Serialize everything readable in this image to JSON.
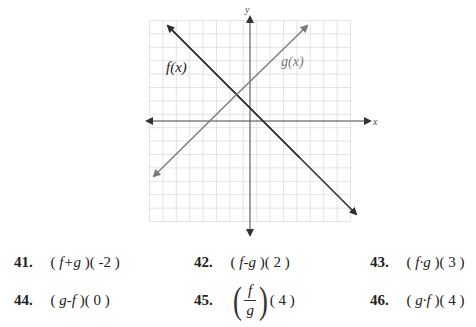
{
  "graph": {
    "x_axis_label": "x",
    "y_axis_label": "y",
    "f_label": "f(x)",
    "g_label": "g(x)",
    "grid_cells": 15,
    "colors": {
      "f_line": "#2e2e2e",
      "g_line": "#7a7a7a",
      "grid": "#d9d9d9",
      "axis": "#555555"
    }
  },
  "chart_data": {
    "type": "line",
    "title": "",
    "xlabel": "x",
    "ylabel": "y",
    "xlim": [
      -7.5,
      7.5
    ],
    "ylim": [
      -7.5,
      7.5
    ],
    "grid": true,
    "series": [
      {
        "name": "f(x)",
        "equation": "f(x) = -x + 1",
        "points": [
          [
            -6,
            7
          ],
          [
            0,
            1
          ],
          [
            1,
            0
          ],
          [
            8,
            -7
          ]
        ]
      },
      {
        "name": "g(x)",
        "equation": "g(x) = x + 3",
        "points": [
          [
            -7,
            -4
          ],
          [
            -3,
            0
          ],
          [
            0,
            3
          ],
          [
            4,
            7
          ]
        ]
      }
    ],
    "annotations": [
      "f(x)",
      "g(x)"
    ]
  },
  "exercises": [
    {
      "num": "41.",
      "op": "f+g",
      "arg": "-2"
    },
    {
      "num": "42.",
      "op": "f-g",
      "arg": "2"
    },
    {
      "num": "43.",
      "op": "f·g",
      "arg": "3"
    },
    {
      "num": "44.",
      "op": "g-f",
      "arg": "0"
    },
    {
      "num": "45.",
      "num_top": "f",
      "num_bottom": "g",
      "arg": "4"
    },
    {
      "num": "46.",
      "op": "g·f",
      "arg": "4"
    }
  ]
}
